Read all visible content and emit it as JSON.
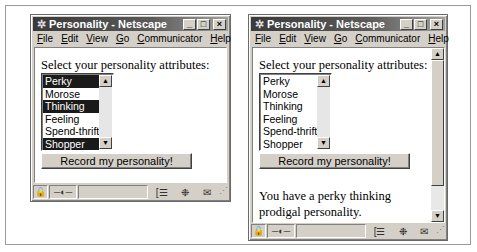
{
  "windows": [
    {
      "id": "before",
      "title": "Personality - Netscape",
      "menu": [
        "File",
        "Edit",
        "View",
        "Go",
        "Communicator",
        "Help"
      ],
      "menu_accels": [
        "F",
        "E",
        "V",
        "G",
        "C",
        "H"
      ],
      "prompt": "Select your personality attributes:",
      "options": [
        {
          "label": "Perky",
          "selected": true
        },
        {
          "label": "Morose",
          "selected": false
        },
        {
          "label": "Thinking",
          "selected": true
        },
        {
          "label": "Feeling",
          "selected": false
        },
        {
          "label": "Spend-thrift",
          "selected": false
        },
        {
          "label": "Shopper",
          "selected": true
        }
      ],
      "submit_label": "Record my personality!",
      "result": ""
    },
    {
      "id": "after",
      "title": "Personality - Netscape",
      "menu": [
        "File",
        "Edit",
        "View",
        "Go",
        "Communicator",
        "Help"
      ],
      "menu_accels": [
        "F",
        "E",
        "V",
        "G",
        "C",
        "H"
      ],
      "prompt": "Select your personality attributes:",
      "options": [
        {
          "label": "Perky",
          "selected": false
        },
        {
          "label": "Morose",
          "selected": false
        },
        {
          "label": "Thinking",
          "selected": false
        },
        {
          "label": "Feeling",
          "selected": false
        },
        {
          "label": "Spend-thrift",
          "selected": false
        },
        {
          "label": "Shopper",
          "selected": false
        }
      ],
      "submit_label": "Record my personality!",
      "result": "You have a perky thinking prodigal personality."
    }
  ],
  "icons": {
    "app": "netscape-logo-icon",
    "minimize": "_",
    "maximize": "□",
    "close": "×",
    "scroll_up": "▲",
    "scroll_down": "▼",
    "status": [
      "security-lock-icon",
      "connection-icon",
      "component-bar-icon",
      "navigator-icon",
      "mail-icon"
    ]
  },
  "colors": {
    "selection": "#1a1a1a",
    "chrome": "#d4d0c8",
    "titlebar": "#3a3a3a"
  }
}
